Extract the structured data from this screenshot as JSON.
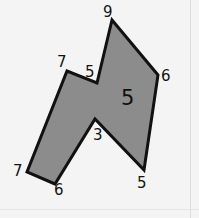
{
  "figure": {
    "kind": "polygon-with-side-length-labels",
    "background_color": "#f4f4f4",
    "shape": {
      "name": "irregular-octagon",
      "fill_color": "#8c8c8c",
      "stroke_color": "#111111",
      "stroke_width": 3,
      "points": "112,20 158,75 144,170 95,119 55,184 27,172 67,71 97,83",
      "vertices": [
        {
          "id": "top-apex",
          "x": 112,
          "y": 20
        },
        {
          "id": "right",
          "x": 158,
          "y": 75
        },
        {
          "id": "bottom-right",
          "x": 144,
          "y": 170
        },
        {
          "id": "bottom-notch-apex",
          "x": 95,
          "y": 119
        },
        {
          "id": "bottom-center",
          "x": 55,
          "y": 184
        },
        {
          "id": "bottom-left",
          "x": 27,
          "y": 172
        },
        {
          "id": "upper-left",
          "x": 67,
          "y": 71
        },
        {
          "id": "top-notch",
          "x": 97,
          "y": 83
        }
      ]
    },
    "labels": [
      {
        "id": "label-top-apex",
        "text": "9",
        "x": 103,
        "y": 5
      },
      {
        "id": "label-upper-left",
        "text": "7",
        "x": 57,
        "y": 55
      },
      {
        "id": "label-top-notch",
        "text": "5",
        "x": 85,
        "y": 65
      },
      {
        "id": "label-right",
        "text": "6",
        "x": 161,
        "y": 69
      },
      {
        "id": "label-bottom-notch",
        "text": "3",
        "x": 93,
        "y": 128
      },
      {
        "id": "label-bottom-left",
        "text": "7",
        "x": 13,
        "y": 164
      },
      {
        "id": "label-bottom-center",
        "text": "6",
        "x": 54,
        "y": 183
      },
      {
        "id": "label-bottom-right",
        "text": "5",
        "x": 137,
        "y": 176
      }
    ],
    "area_label": {
      "id": "label-area-center",
      "text": "5",
      "x": 121,
      "y": 88
    }
  }
}
